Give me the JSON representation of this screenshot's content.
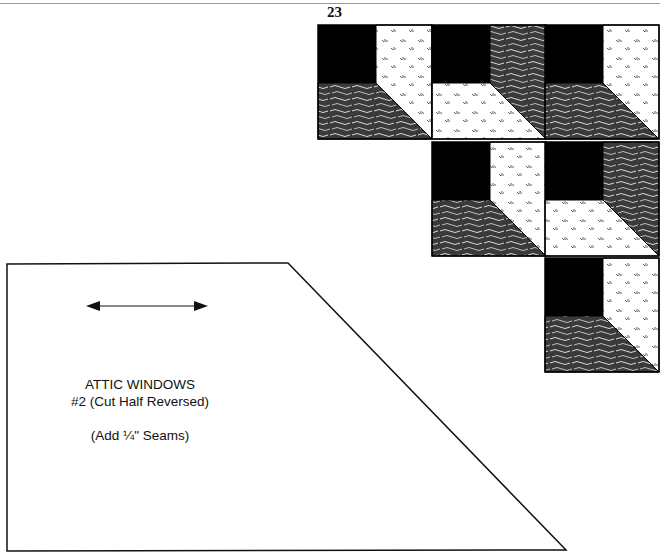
{
  "page": {
    "number": "23"
  },
  "template": {
    "title": "ATTIC WINDOWS",
    "subtitle": "#2 (Cut Half Reversed)",
    "note": "(Add ¼\" Seams)",
    "grain_arrow": "double-headed-arrow"
  },
  "quilt_diagram": {
    "blocks": [
      {
        "row": 1,
        "col": 1,
        "side": "light",
        "bottom": "dark"
      },
      {
        "row": 1,
        "col": 2,
        "side": "dark",
        "bottom": "light"
      },
      {
        "row": 1,
        "col": 3,
        "side": "light",
        "bottom": "dark"
      },
      {
        "row": 2,
        "col": 2,
        "side": "light",
        "bottom": "dark"
      },
      {
        "row": 2,
        "col": 3,
        "side": "dark",
        "bottom": "light"
      },
      {
        "row": 3,
        "col": 3,
        "side": "light",
        "bottom": "dark"
      }
    ],
    "colors": {
      "window": "#000000",
      "dark_fabric": "#3a3a3a",
      "light_fabric": "#ffffff",
      "outline": "#000000"
    }
  }
}
